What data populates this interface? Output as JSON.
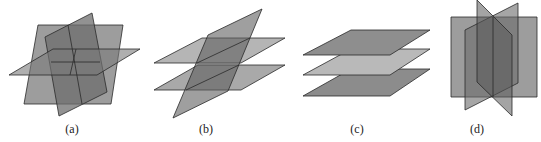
{
  "figure": {
    "panels": [
      {
        "id": "a",
        "label": "(a)",
        "label_x": 72,
        "description": "three planes intersecting in a single point",
        "planes": [
          {
            "name": "vertical-plane-back",
            "points": "38,25 123,25 111,104 24,104",
            "fill": "#8c8c8c",
            "opacity": 0.85
          },
          {
            "name": "tilted-plane",
            "points": "45,37 92,13 107,92 59,116",
            "fill": "#6e6e6e",
            "opacity": 0.75
          },
          {
            "name": "horizontal-plane",
            "points": "9,75 53,49 140,49 97,75",
            "fill": "#7a7a7a",
            "opacity": 0.6
          }
        ],
        "lines": [
          {
            "x1": 68,
            "y1": 25,
            "x2": 82,
            "y2": 104
          },
          {
            "x1": 51,
            "y1": 62,
            "x2": 100,
            "y2": 62
          },
          {
            "x1": 76,
            "y1": 49,
            "x2": 70,
            "y2": 75
          }
        ]
      },
      {
        "id": "b",
        "label": "(b)",
        "label_x": 206,
        "description": "two parallel planes cut by a third plane",
        "planes": [
          {
            "name": "upper-horizontal-plane",
            "points": "154,63 202,38 285,38 241,63",
            "fill": "#a8a8a8",
            "opacity": 0.85
          },
          {
            "name": "lower-horizontal-plane",
            "points": "154,90 198,65 285,65 241,90",
            "fill": "#9a9a9a",
            "opacity": 0.85
          },
          {
            "name": "tilted-plane",
            "points": "208,35 262,9 228,91 173,118",
            "fill": "#5f5f5f",
            "opacity": 0.6
          }
        ],
        "lines": [
          {
            "x1": 197,
            "y1": 63,
            "x2": 250,
            "y2": 38
          },
          {
            "x1": 186,
            "y1": 90,
            "x2": 239,
            "y2": 65
          }
        ]
      },
      {
        "id": "c",
        "label": "(c)",
        "label_x": 357,
        "description": "three parallel planes",
        "planes": [
          {
            "name": "bottom-plane",
            "points": "303,96 351,69 430,69 390,96",
            "fill": "#8c8c8c",
            "opacity": 1
          },
          {
            "name": "middle-plane",
            "points": "303,75 351,49 430,49 390,75",
            "fill": "#b9b9b9",
            "opacity": 1
          },
          {
            "name": "top-plane",
            "points": "303,55 351,30 430,30 390,55",
            "fill": "#8e8e8e",
            "opacity": 1
          }
        ],
        "lines": []
      },
      {
        "id": "d",
        "label": "(d)",
        "label_x": 477,
        "description": "three planes intersecting along a common line",
        "planes": [
          {
            "name": "front-square-plane",
            "points": "451,17 537,17 537,97 451,97",
            "fill": "#8c8c8c",
            "opacity": 0.85
          },
          {
            "name": "oblique-plane-1",
            "points": "465,30 518,3 518,83 465,110",
            "fill": "#6a6a6a",
            "opacity": 0.6
          },
          {
            "name": "oblique-plane-2",
            "points": "477,0 512,35 512,116 477,82",
            "fill": "#5a5a5a",
            "opacity": 0.55
          }
        ],
        "lines": [
          {
            "x1": 493,
            "y1": 17,
            "x2": 493,
            "y2": 97
          }
        ]
      }
    ],
    "stroke_color": "#2a2a2a"
  }
}
